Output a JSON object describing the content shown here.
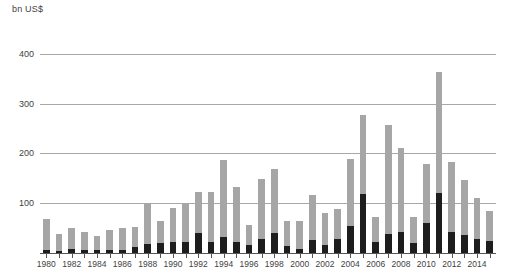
{
  "chart_data": {
    "type": "bar",
    "title": "",
    "subtitle": "",
    "xlabel": "",
    "ylabel": "bn US$",
    "unit_caption": "bn US$",
    "ylim": [
      0,
      430
    ],
    "yticks": [
      100,
      200,
      300,
      400
    ],
    "ytick_labels": [
      "100",
      "200",
      "300",
      "400"
    ],
    "grid": true,
    "legend_position": "none",
    "stacked": true,
    "bar_colors": {
      "lower_segment": "#1d1d1d",
      "upper_segment": "#a6a6a6"
    },
    "categories": [
      "1980",
      "1981",
      "1982",
      "1983",
      "1984",
      "1985",
      "1986",
      "1987",
      "1988",
      "1989",
      "1990",
      "1991",
      "1992",
      "1993",
      "1994",
      "1995",
      "1996",
      "1997",
      "1998",
      "1999",
      "2000",
      "2001",
      "2002",
      "2003",
      "2004",
      "2005",
      "2006",
      "2007",
      "2008",
      "2009",
      "2010",
      "2011",
      "2012",
      "2013",
      "2014",
      "2015"
    ],
    "xtick_labels": [
      "1980",
      "1982",
      "1984",
      "1986",
      "1988",
      "1990",
      "1992",
      "1994",
      "1996",
      "1998",
      "2000",
      "2002",
      "2004",
      "2006",
      "2008",
      "2010",
      "2012",
      "2014"
    ],
    "series": [
      {
        "name": "lower-segment",
        "values": [
          8,
          6,
          10,
          8,
          8,
          9,
          9,
          14,
          20,
          22,
          25,
          24,
          42,
          25,
          35,
          25,
          18,
          30,
          42,
          17,
          10,
          28,
          18,
          30,
          57,
          120,
          25,
          40,
          45,
          22,
          62,
          122,
          45,
          38,
          30,
          26
        ]
      },
      {
        "name": "upper-segment",
        "values": [
          62,
          34,
          42,
          36,
          28,
          39,
          43,
          40,
          80,
          44,
          67,
          76,
          82,
          100,
          153,
          109,
          40,
          120,
          128,
          49,
          57,
          90,
          65,
          60,
          133,
          160,
          50,
          220,
          168,
          52,
          118,
          243,
          140,
          110,
          82,
          61
        ]
      }
    ],
    "totals": [
      70,
      40,
      52,
      44,
      36,
      48,
      52,
      54,
      100,
      66,
      92,
      100,
      124,
      125,
      188,
      134,
      58,
      150,
      170,
      66,
      67,
      118,
      83,
      90,
      190,
      280,
      75,
      260,
      213,
      74,
      180,
      365,
      185,
      148,
      112,
      87
    ]
  }
}
